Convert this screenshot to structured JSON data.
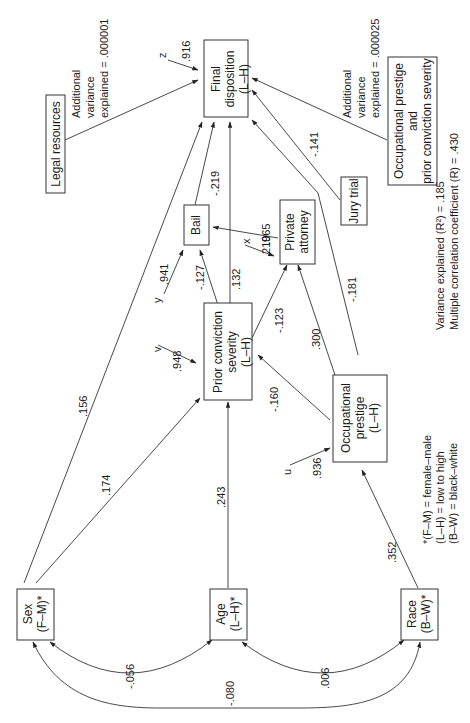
{
  "diagram": {
    "type": "path-diagram",
    "orientation": "rotated-90-ccw",
    "nodes": {
      "final_disposition": {
        "line1": "Final",
        "line2": "disposition",
        "line3": "(L–H)"
      },
      "legal_resources": {
        "label": "Legal resources"
      },
      "bail": {
        "label": "Bail"
      },
      "private_attorney": {
        "line1": "Private",
        "line2": "attorney"
      },
      "jury_trial": {
        "label": "Jury trial"
      },
      "occ_prior": {
        "line1": "Occupational prestige",
        "line2": "and",
        "line3": "prior conviction severity"
      },
      "prior_conviction": {
        "line1": "Prior conviction",
        "line2": "severity",
        "line3": "(L–H)"
      },
      "occupational_prestige": {
        "line1": "Occupational",
        "line2": "prestige",
        "line3": "(L–H)"
      },
      "sex": {
        "line1": "Sex",
        "line2": "(F–M)*"
      },
      "age": {
        "line1": "Age",
        "line2": "(L–H)*"
      },
      "race": {
        "line1": "Race",
        "line2": "(B–W)*"
      }
    },
    "residuals": {
      "z": {
        "name": "z",
        "value": ".916"
      },
      "x": {
        "name": "x",
        "value": ".965"
      },
      "y_bail": {
        "name": "y",
        "value": ".941"
      },
      "v": {
        "name": "v",
        "value": ".948"
      },
      "u": {
        "name": "u",
        "value": ".936"
      }
    },
    "paths": {
      "sex_final": ".156",
      "sex_prior": ".174",
      "age_prior": ".243",
      "race_occ": ".352",
      "bail_final": "-.219",
      "prior_bail": "-.127",
      "prior_final": ".132",
      "prior_attorney": "-.123",
      "attorney_bail": ".210",
      "occ_prior": "-.160",
      "occ_attorney": ".300",
      "occ_final": "-.181",
      "jury_final": "-.141"
    },
    "correlations": {
      "sex_age": "-.056",
      "sex_race": "-.080",
      "age_race": ".006"
    },
    "annotations": {
      "legal_var_1": "Additional",
      "legal_var_2": "variance",
      "legal_var_3": "explained = .000001",
      "occ_var_1": "Additional",
      "occ_var_2": "variance",
      "occ_var_3": "explained = .000025",
      "variance_explained": "Variance explained (R²) = .185",
      "multiple_correlation": "Multiple correlation coefficient (R) = .430"
    },
    "legend": {
      "line1": "*(F–M) = female–male",
      "line2": "(L–H) = low to high",
      "line3": "(B–W) = black–white"
    }
  }
}
